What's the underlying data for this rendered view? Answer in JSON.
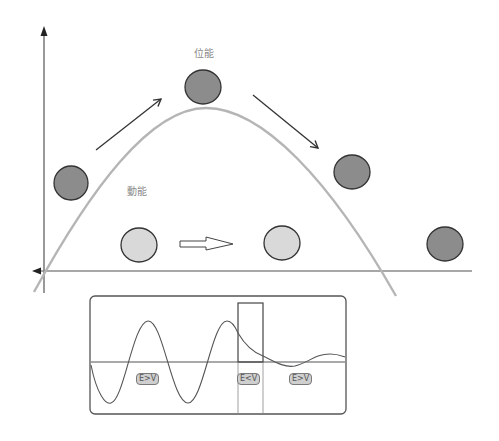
{
  "labels": {
    "potential_energy": "位能",
    "kinetic_energy": "動能"
  },
  "inset": {
    "region_labels": [
      "E>V",
      "E<V",
      "E>V"
    ]
  },
  "colors": {
    "ball_dark": "#8c8c8c",
    "ball_light": "#d9d9d9",
    "curve": "#b0b0b0",
    "axis": "#6e6e6e",
    "arrow": "#333333"
  },
  "balls": [
    {
      "name": "left",
      "cx": 71,
      "cy": 183,
      "tone": "dark"
    },
    {
      "name": "top",
      "cx": 203,
      "cy": 87,
      "tone": "dark"
    },
    {
      "name": "right",
      "cx": 352,
      "cy": 172,
      "tone": "dark"
    },
    {
      "name": "ground-left",
      "cx": 139,
      "cy": 245,
      "tone": "light"
    },
    {
      "name": "ground-middle",
      "cx": 282,
      "cy": 243,
      "tone": "light"
    },
    {
      "name": "ground-right",
      "cx": 445,
      "cy": 244,
      "tone": "dark"
    }
  ]
}
